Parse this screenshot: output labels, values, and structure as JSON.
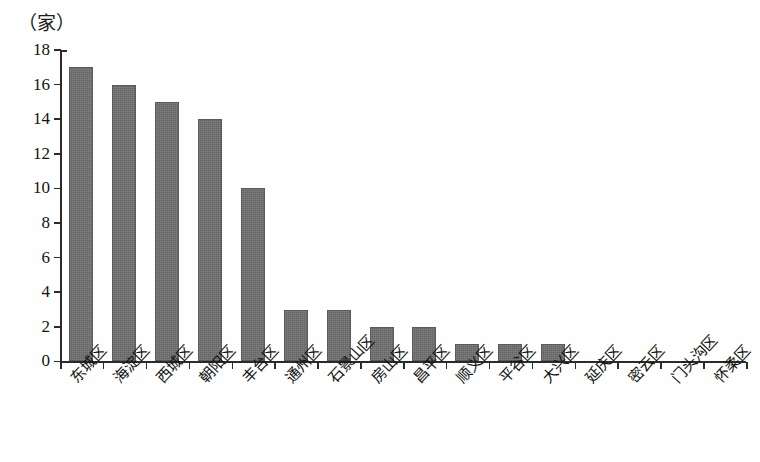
{
  "chart_data": {
    "type": "bar",
    "title": "",
    "subtitle": "",
    "unit_label": "（家）",
    "xlabel": "",
    "ylabel": "",
    "ylim": [
      0,
      18
    ],
    "ytick_step": 2,
    "yticks": [
      0,
      2,
      4,
      6,
      8,
      10,
      12,
      14,
      16,
      18
    ],
    "grid": false,
    "legend": null,
    "bar_color": "#6f6f6f",
    "axis_color": "#2b2b2b",
    "background_color": "#ffffff",
    "categories": [
      "东城区",
      "海淀区",
      "西城区",
      "朝阳区",
      "丰台区",
      "通州区",
      "石景山区",
      "房山区",
      "昌平区",
      "顺义区",
      "平谷区",
      "大兴区",
      "延庆区",
      "密云区",
      "门头沟区",
      "怀柔区"
    ],
    "values": [
      17,
      16,
      15,
      14,
      10,
      3,
      3,
      2,
      2,
      1,
      1,
      1,
      0,
      0,
      0,
      0
    ]
  }
}
